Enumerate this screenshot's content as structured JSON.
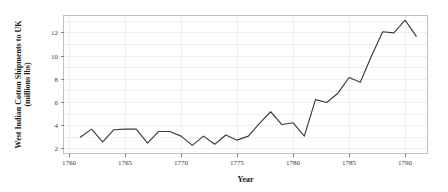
{
  "chart_data": {
    "type": "line",
    "title": "",
    "xlabel": "Year",
    "ylabel": "West Indian Cotton Shipments to UK",
    "ylabel_line2": "(millions lbs)",
    "xlim": [
      1759.5,
      1792.0
    ],
    "ylim": [
      1.6,
      13.5
    ],
    "grid": true,
    "legend": null,
    "x_ticks": [
      1760,
      1765,
      1770,
      1775,
      1780,
      1785,
      1790
    ],
    "x_tick_labels": [
      "1760",
      "1765",
      "1770",
      "1775",
      "1780",
      "1785",
      "1790"
    ],
    "y_ticks": [
      2,
      4,
      6,
      8,
      10,
      12
    ],
    "y_tick_labels": [
      "2",
      "4",
      "6",
      "8",
      "10",
      "12"
    ],
    "line_color": "#3c3c3c",
    "grid_color": "#e8e8ea",
    "frame_color": "#b9b9bd",
    "series": [
      {
        "name": "West Indian Cotton Shipments to UK",
        "x": [
          1761,
          1762,
          1763,
          1764,
          1765,
          1766,
          1767,
          1768,
          1769,
          1770,
          1771,
          1772,
          1773,
          1774,
          1775,
          1776,
          1777,
          1778,
          1779,
          1780,
          1781,
          1782,
          1783,
          1784,
          1785,
          1786,
          1787,
          1788,
          1789,
          1790,
          1791
        ],
        "values": [
          3.0,
          3.7,
          2.6,
          3.65,
          3.7,
          3.7,
          2.5,
          3.5,
          3.5,
          3.1,
          2.3,
          3.1,
          2.4,
          3.2,
          2.75,
          3.1,
          4.2,
          5.2,
          4.1,
          4.25,
          3.1,
          6.25,
          6.0,
          6.8,
          8.15,
          7.75,
          10.0,
          12.1,
          12.0,
          13.1,
          11.7
        ]
      }
    ]
  }
}
